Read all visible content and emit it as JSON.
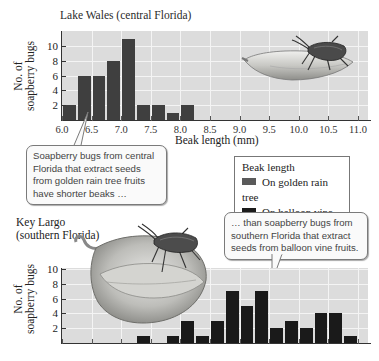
{
  "top_chart": {
    "title": "Lake Wales (central Florida)",
    "ylabel_line1": "No. of",
    "ylabel_line2": "soapberry bugs",
    "xlabel": "Beak length (mm)",
    "yticks": [
      "2",
      "4",
      "6",
      "8",
      "10"
    ],
    "xticks": [
      "6.0",
      "6.5",
      "7.0",
      "7.5",
      "8.0",
      "8.5",
      "9.0",
      "9.5",
      "10.0",
      "10.5",
      "11.0"
    ],
    "illustration": "soapberry bug on golden rain tree fruit"
  },
  "bottom_chart": {
    "title_line1": "Key Largo",
    "title_line2": "(southern Florida)",
    "ylabel_line1": "No. of",
    "ylabel_line2": "soapberry bugs",
    "yticks": [
      "2",
      "4",
      "6",
      "8",
      "10"
    ],
    "illustration": "soapberry bug on balloon vine fruit"
  },
  "legend": {
    "title": "Beak length",
    "items": [
      {
        "label": "On golden rain tree",
        "color": "#5a5a5a"
      },
      {
        "label": "On balloon vine",
        "color": "#1a1a1a"
      }
    ]
  },
  "callouts": {
    "left": "Soapberry bugs from central Florida that extract seeds from golden rain tree fruits have shorter beaks …",
    "right": "… than soapberry bugs from southern Florida that extract seeds from balloon vine fruits."
  },
  "chart_data": [
    {
      "type": "bar",
      "title": "Lake Wales (central Florida)",
      "xlabel": "Beak length (mm)",
      "ylabel": "No. of soapberry bugs",
      "series_name": "On golden rain tree",
      "bin_width": 0.25,
      "x": [
        6.0,
        6.25,
        6.5,
        6.75,
        7.0,
        7.25,
        7.5,
        7.75,
        8.0
      ],
      "values": [
        2,
        6,
        6,
        8,
        11,
        2,
        2,
        1,
        2
      ],
      "xlim": [
        6.0,
        11.0
      ],
      "ylim": [
        0,
        12
      ],
      "grid": true
    },
    {
      "type": "bar",
      "title": "Key Largo (southern Florida)",
      "xlabel": "Beak length (mm)",
      "ylabel": "No. of soapberry bugs",
      "series_name": "On balloon vine",
      "bin_width": 0.25,
      "x": [
        7.25,
        7.75,
        8.0,
        8.25,
        8.5,
        8.75,
        9.0,
        9.25,
        9.5,
        9.75,
        10.0,
        10.25,
        10.5,
        10.75
      ],
      "values": [
        1,
        1,
        3,
        1,
        3,
        7,
        5,
        7,
        2,
        3,
        2,
        4,
        4,
        1
      ],
      "xlim": [
        6.0,
        11.0
      ],
      "ylim": [
        0,
        10
      ],
      "grid": true
    }
  ]
}
